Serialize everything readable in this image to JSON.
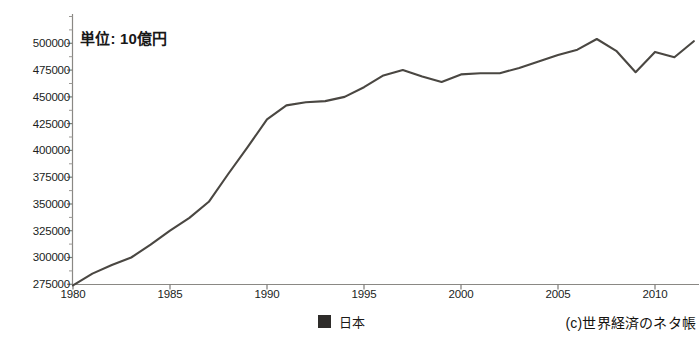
{
  "annotation": {
    "unit_note": "単位: 10億円"
  },
  "legend": {
    "position": "bottom-center",
    "series_label": "日本",
    "swatch_color": "#2e2c2a",
    "swatch_name": "legend-swatch-japan"
  },
  "credit": {
    "text": "(c)世界経済のネタ帳"
  },
  "axes": {
    "y_ticks": [
      "500000",
      "475000",
      "450000",
      "425000",
      "400000",
      "375000",
      "350000",
      "325000",
      "300000",
      "275000"
    ],
    "x_ticks": [
      "1980",
      "1985",
      "1990",
      "1995",
      "2000",
      "2005",
      "2010"
    ]
  },
  "chart_data": {
    "type": "line",
    "title": "",
    "subtitle": "",
    "xlabel": "",
    "ylabel": "",
    "annotations": [
      "単位: 10億円"
    ],
    "grid": false,
    "legend_position": "bottom-center",
    "line_color": "#4a4742",
    "xlim": [
      1980,
      2012
    ],
    "ylim": [
      275000,
      512000
    ],
    "ytick_values": [
      275000,
      300000,
      325000,
      350000,
      375000,
      400000,
      425000,
      450000,
      475000,
      500000
    ],
    "xtick_values": [
      1980,
      1985,
      1990,
      1995,
      2000,
      2005,
      2010
    ],
    "x": [
      1980,
      1981,
      1982,
      1983,
      1984,
      1985,
      1986,
      1987,
      1988,
      1989,
      1990,
      1991,
      1992,
      1993,
      1994,
      1995,
      1996,
      1997,
      1998,
      1999,
      2000,
      2001,
      2002,
      2003,
      2004,
      2005,
      2006,
      2007,
      2008,
      2009,
      2010,
      2011,
      2012
    ],
    "series": [
      {
        "name": "日本",
        "values": [
          274000,
          285000,
          293000,
          300000,
          312000,
          325000,
          337000,
          352000,
          378000,
          403000,
          429000,
          442000,
          445000,
          446000,
          450000,
          459000,
          470000,
          475000,
          469000,
          464000,
          471000,
          472000,
          472000,
          477000,
          483000,
          489000,
          494000,
          504000,
          493000,
          473000,
          492000,
          487000,
          502000
        ]
      }
    ]
  }
}
